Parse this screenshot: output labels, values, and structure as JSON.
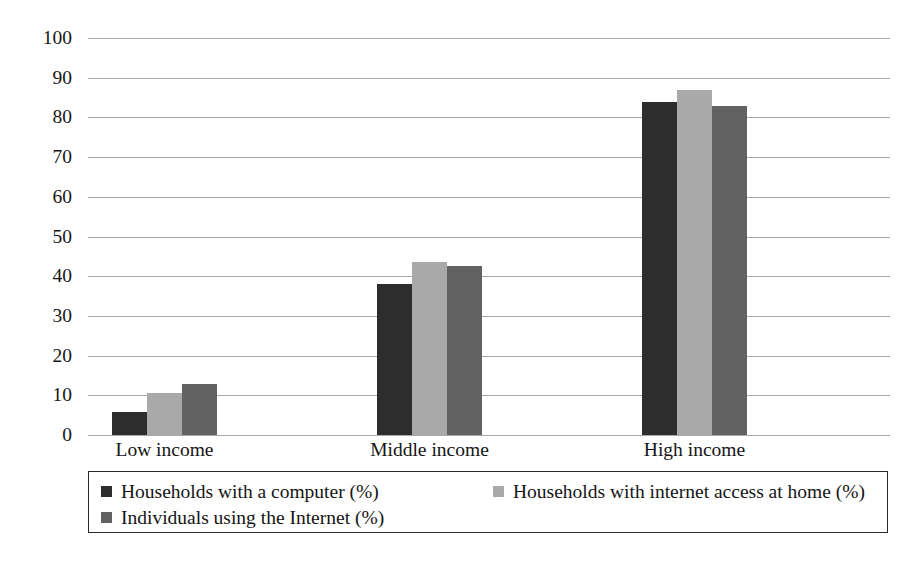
{
  "chart_data": {
    "type": "bar",
    "title": "",
    "subtitle": "",
    "xlabel": "",
    "ylabel": "",
    "categories": [
      "Low income",
      "Middle income",
      "High income"
    ],
    "series": [
      {
        "name": "Households with a computer (%)",
        "color": "#2d2d2d",
        "values": [
          5.8,
          38.0,
          83.8
        ]
      },
      {
        "name": "Households with internet access at home (%)",
        "color": "#a9a9a9",
        "values": [
          10.5,
          43.6,
          86.8
        ]
      },
      {
        "name": "Individuals using the Internet (%)",
        "color": "#626262",
        "values": [
          12.8,
          42.5,
          82.8
        ]
      }
    ],
    "ylim": [
      0,
      100
    ],
    "ytick_step": 10,
    "yticks": [
      "100",
      "90",
      "80",
      "70",
      "60",
      "50",
      "40",
      "30",
      "20",
      "10",
      "0"
    ],
    "grid": true,
    "grid_color": "#9a9a9a",
    "legend_position": "bottom",
    "legend_border_color": "#2a2a2a",
    "background": "#ffffff"
  },
  "legend": {
    "entries": [
      {
        "label": "Households with a computer (%)",
        "swatch": "legend-swatch-dark"
      },
      {
        "label": "Households with internet access at home (%)",
        "swatch": "legend-swatch-light"
      },
      {
        "label": "Individuals using the Internet (%)",
        "swatch": "legend-swatch-medium"
      }
    ]
  }
}
